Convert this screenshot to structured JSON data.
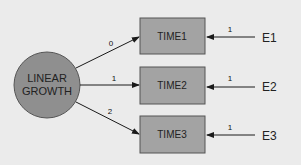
{
  "diagram": {
    "type": "structural-equation-model",
    "background": "#ebebeb",
    "latent": {
      "label_line1": "LINEAR",
      "label_line2": "GROWTH",
      "fill": "#8f8f8f",
      "stroke": "#555555"
    },
    "observed": [
      {
        "label": "TIME1",
        "fill": "#a3a3a3"
      },
      {
        "label": "TIME2",
        "fill": "#a3a3a3"
      },
      {
        "label": "TIME3",
        "fill": "#a3a3a3"
      }
    ],
    "loadings": [
      {
        "value": "0"
      },
      {
        "value": "1"
      },
      {
        "value": "2"
      }
    ],
    "errors": [
      {
        "label": "E1",
        "path_value": "1"
      },
      {
        "label": "E2",
        "path_value": "1"
      },
      {
        "label": "E3",
        "path_value": "1"
      }
    ]
  }
}
